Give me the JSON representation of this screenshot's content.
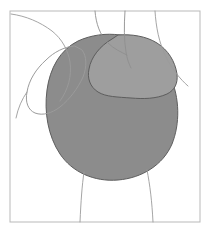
{
  "figure": {
    "title": "Anatomical contour diagram",
    "canvas": {
      "width": 211,
      "height": 232,
      "background_color": "#ffffff"
    },
    "frame": {
      "name": "figure-border",
      "x": 10,
      "y": 11,
      "width": 190,
      "height": 211,
      "stroke_color": "#b9b9b9",
      "stroke_width": 1
    },
    "regions": [
      {
        "name": "main-shaded-mass",
        "label": "Deltoid mass",
        "fill_color": "#8c8c8c",
        "stroke_color": "#5d5d5d",
        "stroke_width": 1,
        "path": "M 120 35 C 142 38 160 54 170 76 C 180 98 180 124 172 144 C 163 165 142 178 118 180 C 94 182 72 172 60 154 C 48 136 44 112 47 90 C 50 68 60 50 78 41 C 91 35 106 33 120 35 Z"
      },
      {
        "name": "light-lobe",
        "label": "Adjoining lighter lobe",
        "fill_color": "#9e9e9e",
        "stroke_color": "#5d5d5d",
        "stroke_width": 1,
        "path": "M 118 35 C 131 34 146 36 157 43 C 168 50 175 61 177 74 C 178 83 175 90 167 94 C 156 99 143 99 131 98 C 118 97 106 97 98 92 C 90 87 87 78 89 69 C 91 57 100 46 112 39 Z"
      },
      {
        "name": "outlined-lobe-left",
        "label": "Unfilled lobe at left",
        "fill_color": "none",
        "stroke_color": "#9b9b9b",
        "stroke_width": 1,
        "path": "M 74 46 C 64 47 54 52 46 60 C 36 69 29 80 27 92 C 25 102 28 110 35 113 C 43 116 52 113 60 107 C 70 99 78 88 83 77 C 87 67 87 56 82 50 Z"
      }
    ],
    "contours": [
      {
        "name": "contour-upper-left",
        "stroke_color": "#9b9b9b",
        "stroke_width": 0.9,
        "path": "M 11 14 C 26 16 40 22 52 31 C 62 39 68 50 70 62 C 72 76 68 90 60 101"
      },
      {
        "name": "contour-neck-left",
        "stroke_color": "#8f8f8f",
        "stroke_width": 0.9,
        "path": "M 95 11 C 96 24 100 35 108 43 C 114 49 121 52 127 55"
      },
      {
        "name": "contour-neck-right",
        "stroke_color": "#8f8f8f",
        "stroke_width": 0.9,
        "path": "M 125 11 C 124 26 124 40 126 52 C 127 59 129 64 131 68"
      },
      {
        "name": "contour-shoulder-right",
        "stroke_color": "#9b9b9b",
        "stroke_width": 0.9,
        "path": "M 155 11 C 156 27 159 43 166 57 C 172 69 180 79 188 86"
      },
      {
        "name": "contour-torso-left",
        "stroke_color": "#9b9b9b",
        "stroke_width": 0.9,
        "path": "M 84 172 C 82 186 81 200 80 222"
      },
      {
        "name": "contour-torso-right",
        "stroke_color": "#9b9b9b",
        "stroke_width": 0.9,
        "path": "M 147 170 C 150 185 152 202 153 222"
      },
      {
        "name": "contour-armpit-left",
        "stroke_color": "#9b9b9b",
        "stroke_width": 0.9,
        "path": "M 27 92 C 22 99 18 108 16 118"
      }
    ]
  }
}
